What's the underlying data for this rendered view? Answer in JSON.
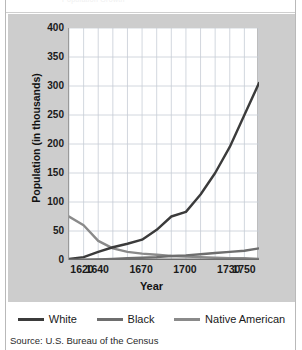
{
  "figure": {
    "clipped_caption": "Population Growth",
    "source": "Source: U.S. Bureau of the Census"
  },
  "axes": {
    "ytitle": "Population (in thousands)",
    "xtitle": "Year",
    "yticks": [
      "400",
      "350",
      "300",
      "250",
      "200",
      "150",
      "100",
      "50",
      "0"
    ],
    "xticks": [
      "1620",
      "1640",
      "1670",
      "1700",
      "1730",
      "1750"
    ]
  },
  "legend": {
    "items": [
      {
        "label": "White",
        "color": "#3b3b3b"
      },
      {
        "label": "Black",
        "color": "#6e6e6e"
      },
      {
        "label": "Native American",
        "color": "#8a8a8a"
      }
    ]
  },
  "chart_data": {
    "type": "line",
    "title": "Population Growth",
    "xlabel": "Year",
    "ylabel": "Population (in thousands)",
    "xlim": [
      1620,
      1750
    ],
    "ylim": [
      0,
      400
    ],
    "ytick_values": [
      0,
      50,
      100,
      150,
      200,
      250,
      300,
      350,
      400
    ],
    "xtick_values": [
      1620,
      1640,
      1670,
      1700,
      1730,
      1750
    ],
    "grid": true,
    "legend_position": "bottom",
    "series": [
      {
        "name": "White",
        "color": "#3b3b3b",
        "x": [
          1620,
          1630,
          1640,
          1650,
          1660,
          1670,
          1680,
          1690,
          1700,
          1710,
          1720,
          1730,
          1740,
          1750
        ],
        "values": [
          2,
          5,
          14,
          22,
          28,
          35,
          52,
          75,
          83,
          113,
          150,
          195,
          250,
          305
        ]
      },
      {
        "name": "Black",
        "color": "#6e6e6e",
        "x": [
          1620,
          1630,
          1640,
          1650,
          1660,
          1670,
          1680,
          1690,
          1700,
          1710,
          1720,
          1730,
          1740,
          1750
        ],
        "values": [
          0,
          0,
          1,
          2,
          3,
          4,
          5,
          7,
          8,
          10,
          12,
          14,
          16,
          20
        ]
      },
      {
        "name": "Native American",
        "color": "#8a8a8a",
        "x": [
          1620,
          1630,
          1640,
          1650,
          1660,
          1670,
          1680,
          1690,
          1700,
          1710,
          1720,
          1730,
          1740,
          1750
        ],
        "values": [
          75,
          60,
          33,
          20,
          14,
          11,
          9,
          7,
          6,
          5,
          4,
          3,
          3,
          2
        ]
      }
    ]
  }
}
